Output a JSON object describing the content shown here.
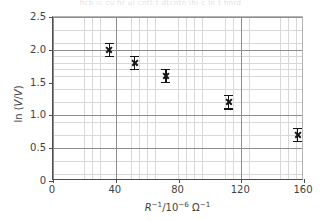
{
  "top_strip_text": "hcb ic cu hr ui cntt t dtcntn  ihi c  ln t hnrd",
  "chart_data": {
    "type": "scatter",
    "title": "",
    "xlabel": "R^-1 / 10^-6 ohm^-1",
    "xlabel_parts": {
      "symbol": "R",
      "symbol_exponent": "−1",
      "divider": "/10",
      "scale_exponent": "−6",
      "unit": "Ω",
      "unit_exponent": "−1"
    },
    "ylabel": "ln (V/V)",
    "ylabel_parts": {
      "prefix": "ln (",
      "numerator": "V",
      "slash": "/",
      "denominator": "V",
      "suffix": ")"
    },
    "xlim": [
      0,
      160
    ],
    "ylim": [
      0,
      2.5
    ],
    "xticks": [
      0,
      40,
      80,
      120,
      160
    ],
    "xticklabels": [
      "0",
      "40",
      "80",
      "120",
      "160"
    ],
    "yticks": [
      0,
      0.5,
      1.0,
      1.5,
      2.0,
      2.5
    ],
    "yticklabels": [
      "0",
      "0.5",
      "1.0",
      "1.5",
      "2.0",
      "2.5"
    ],
    "x_minor_step": 5,
    "y_minor_step": 0.1,
    "grid": true,
    "grid_minor": true,
    "legend": "none",
    "marker": "x",
    "marker_color": "#151515",
    "errorbar_color": "#151515",
    "points": [
      {
        "x": 36,
        "y": 2.0,
        "yerr": 0.1
      },
      {
        "x": 52,
        "y": 1.8,
        "yerr": 0.1
      },
      {
        "x": 72,
        "y": 1.6,
        "yerr": 0.1
      },
      {
        "x": 112,
        "y": 1.2,
        "yerr": 0.1
      },
      {
        "x": 156,
        "y": 0.7,
        "yerr": 0.1
      }
    ],
    "x": [
      36,
      52,
      72,
      112,
      156
    ],
    "values": [
      2.0,
      1.8,
      1.6,
      1.2,
      0.7
    ],
    "yerr": [
      0.1,
      0.1,
      0.1,
      0.1,
      0.1
    ]
  },
  "colors": {
    "axis": "#4d4d4d",
    "grid_major": "#8d8d8d",
    "grid_minor": "#d8d8d8",
    "text": "#3f3f3f",
    "data": "#151515",
    "background": "#ffffff"
  }
}
